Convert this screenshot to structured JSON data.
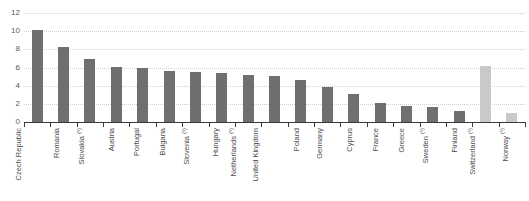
{
  "chart_data": {
    "type": "bar",
    "title": "",
    "subtitle": "",
    "xlabel": "",
    "ylabel": "",
    "ylim": [
      0,
      12
    ],
    "yticks": [
      0,
      2,
      4,
      6,
      8,
      10,
      12
    ],
    "grid": true,
    "legend": null,
    "categories": [
      "Czech Republic",
      "Romania",
      "Slovakia (¹)",
      "Austria",
      "Portugal",
      "Bulgaria",
      "Slovenia (¹)",
      "Hungary",
      "Netherlands (¹)",
      "United Kingdom",
      "Poland",
      "Germany",
      "Cyprus",
      "France",
      "Greece",
      "Sweden (¹)",
      "Finland",
      "Switzerland (¹)",
      "Norway (¹)"
    ],
    "values": [
      10.1,
      8.3,
      6.9,
      6.1,
      6.0,
      5.6,
      5.5,
      5.4,
      5.2,
      5.1,
      4.6,
      3.9,
      3.1,
      2.1,
      1.8,
      1.6,
      1.2,
      6.2,
      1.0
    ],
    "bar_colors": [
      "#6f6f6f",
      "#6f6f6f",
      "#6f6f6f",
      "#6f6f6f",
      "#6f6f6f",
      "#6f6f6f",
      "#6f6f6f",
      "#6f6f6f",
      "#6f6f6f",
      "#6f6f6f",
      "#6f6f6f",
      "#6f6f6f",
      "#6f6f6f",
      "#6f6f6f",
      "#6f6f6f",
      "#6f6f6f",
      "#6f6f6f",
      "#c9c9c9",
      "#c9c9c9"
    ]
  },
  "colors": {
    "bar_primary": "#6f6f6f",
    "bar_secondary": "#c9c9c9",
    "grid": "#cfcfcf",
    "axis": "#3a3a3a",
    "tick_text": "#58585a",
    "background": "#ffffff"
  }
}
